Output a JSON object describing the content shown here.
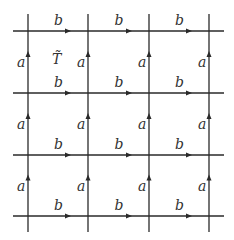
{
  "diagram": {
    "type": "square lattice covering space with labeled directed edges",
    "grid": {
      "xs": [
        28,
        88,
        149,
        209
      ],
      "ys": [
        31,
        93,
        155,
        216
      ],
      "h_extent": [
        13,
        224
      ],
      "v_extent": [
        14,
        232
      ]
    },
    "horizontal_edge_label": "b",
    "vertical_edge_label": "a",
    "region_label": "T̃",
    "line_color": "#2a2a2a"
  }
}
